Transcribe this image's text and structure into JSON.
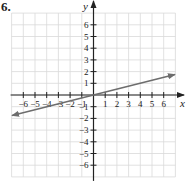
{
  "problem": {
    "number": "6."
  },
  "chart_data": {
    "type": "line",
    "title": "",
    "xlabel": "x",
    "ylabel": "y",
    "xlim": [
      -7,
      7
    ],
    "ylim": [
      -7,
      7
    ],
    "grid": true,
    "x_ticks": [
      -6,
      -5,
      -4,
      -3,
      -2,
      -1,
      1,
      2,
      3,
      4,
      5,
      6
    ],
    "y_ticks": [
      -6,
      -5,
      -4,
      -3,
      -2,
      -1,
      1,
      2,
      3,
      4,
      5,
      6
    ],
    "series": [
      {
        "name": "line",
        "equation": "y = x/4",
        "slope": 0.25,
        "intercept": 0,
        "x": [
          -7,
          7
        ],
        "y": [
          -1.75,
          1.75
        ],
        "arrows": "both",
        "color": "#6d6d6d"
      }
    ]
  },
  "colors": {
    "grid": "#d9d9d9",
    "axis": "#222222",
    "line": "#6d6d6d"
  }
}
